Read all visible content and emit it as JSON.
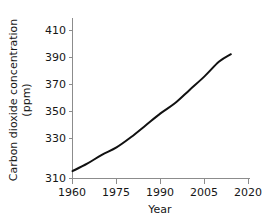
{
  "chart_data": {
    "type": "line",
    "title": "",
    "subtitle": "",
    "xlabel": "Year",
    "ylabel": "Carbon dioxide concentration (ppm)",
    "ylabel_line1": "Carbon dioxide concentration",
    "ylabel_line2": "(ppm)",
    "xlim": [
      1960,
      2021
    ],
    "ylim": [
      310,
      415
    ],
    "grid": false,
    "legend": false,
    "legend_position": "none",
    "line_color": "#111111",
    "axis_color": "#8c8c8c",
    "text_color": "#161616",
    "background": "#ffffff",
    "xticks": [
      1960,
      1975,
      1990,
      2005,
      2020
    ],
    "xtick_labels": [
      "1960",
      "1975",
      "1990",
      "2005",
      "2020"
    ],
    "yticks": [
      310,
      330,
      350,
      370,
      390,
      410
    ],
    "ytick_labels": [
      "310",
      "330",
      "350",
      "370",
      "390",
      "410"
    ],
    "x": [
      1960,
      1965,
      1970,
      1975,
      1980,
      1985,
      1990,
      1995,
      2000,
      2005,
      2010,
      2014
    ],
    "values": [
      315,
      320,
      326,
      331,
      338,
      346,
      354,
      361,
      370,
      379,
      389,
      394
    ],
    "series": [
      {
        "name": "Carbon dioxide concentration",
        "x": [
          1960,
          1965,
          1970,
          1975,
          1980,
          1985,
          1990,
          1995,
          2000,
          2005,
          2010,
          2014
        ],
        "values": [
          315,
          320,
          326,
          331,
          338,
          346,
          354,
          361,
          370,
          379,
          389,
          394
        ]
      }
    ],
    "annotations": []
  }
}
